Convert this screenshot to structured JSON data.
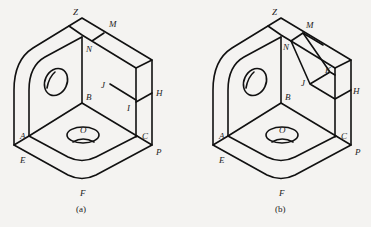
{
  "figures": [
    {
      "id": "a",
      "caption": "(a)",
      "labels": {
        "Z": "Z",
        "M": "M",
        "N": "N",
        "J": "J",
        "H": "H",
        "I": "I",
        "B": "B",
        "A": "A",
        "C": "C",
        "O": "O",
        "E": "E",
        "P": "P",
        "F": "F"
      }
    },
    {
      "id": "b",
      "caption": "(b)",
      "labels": {
        "Z": "Z",
        "M": "M",
        "N": "N",
        "J": "J",
        "K": "K",
        "H": "H",
        "B": "B",
        "A": "A",
        "C": "C",
        "O": "O",
        "E": "E",
        "P": "P",
        "F": "F"
      }
    }
  ]
}
